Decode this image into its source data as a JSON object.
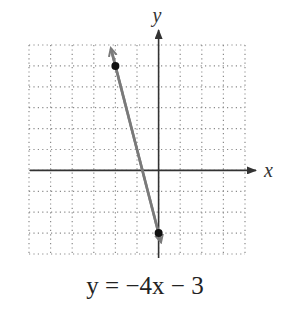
{
  "chart_data": {
    "type": "line",
    "title": "",
    "equation": "y = −4x − 3",
    "xlabel": "x",
    "ylabel": "y",
    "xlim": [
      -6,
      4
    ],
    "ylim": [
      -4,
      6
    ],
    "grid": true,
    "grid_style": "dotted",
    "series": [
      {
        "name": "y = -4x - 3",
        "slope": -4,
        "intercept": -3,
        "marked_points": [
          [
            -2,
            5
          ],
          [
            0,
            -3
          ]
        ],
        "x": [
          -2.2,
          0.1
        ],
        "y": [
          5.8,
          -3.4
        ],
        "arrows_both_ends": true,
        "color": "#7a7a7a"
      }
    ]
  },
  "labels": {
    "x_axis": "x",
    "y_axis": "y",
    "equation": "y = −4x − 3"
  },
  "colors": {
    "axis": "#333333",
    "grid": "#888888",
    "line": "#7a7a7a",
    "point": "#111111"
  }
}
